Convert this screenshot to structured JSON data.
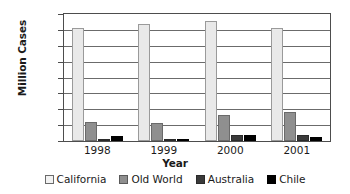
{
  "chart_data": {
    "type": "bar",
    "title": "",
    "xlabel": "Year",
    "ylabel": "Million Cases",
    "categories": [
      "1998",
      "1999",
      "2000",
      "2001"
    ],
    "series": [
      {
        "name": "California",
        "values": [
          143,
          147,
          151,
          143
        ],
        "color": "#e9e9e9"
      },
      {
        "name": "Old World",
        "values": [
          24,
          23,
          33,
          36
        ],
        "color": "#8f8f8f"
      },
      {
        "name": "Australia",
        "values": [
          3,
          3,
          7,
          7
        ],
        "color": "#3a3a3a"
      },
      {
        "name": "Chile",
        "values": [
          6,
          3,
          7,
          5
        ],
        "color": "#000000"
      }
    ],
    "ylim": [
      0,
      160
    ],
    "ytick_step": 20,
    "yticks": [
      "160",
      "140",
      "120",
      "100",
      "80",
      "60",
      "40",
      "20",
      "0"
    ],
    "grid": true,
    "legend_position": "bottom"
  }
}
